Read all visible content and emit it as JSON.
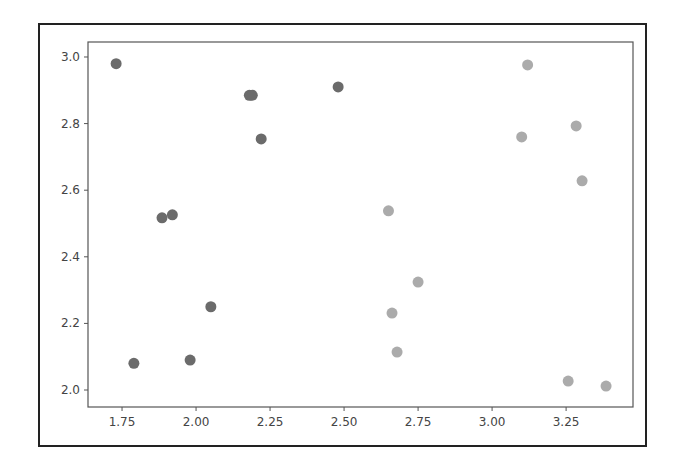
{
  "chart_data": {
    "type": "scatter",
    "title": "",
    "xlabel": "",
    "ylabel": "",
    "xlim": [
      1.635,
      3.476
    ],
    "ylim": [
      1.949,
      3.045
    ],
    "grid": false,
    "legend": null,
    "x_ticks": [
      {
        "value": 1.75,
        "label": "1.75"
      },
      {
        "value": 2.0,
        "label": "2.00"
      },
      {
        "value": 2.25,
        "label": "2.25"
      },
      {
        "value": 2.5,
        "label": "2.50"
      },
      {
        "value": 2.75,
        "label": "2.75"
      },
      {
        "value": 3.0,
        "label": "3.00"
      },
      {
        "value": 3.25,
        "label": "3.25"
      }
    ],
    "y_ticks": [
      {
        "value": 2.0,
        "label": "2.0"
      },
      {
        "value": 2.2,
        "label": "2.2"
      },
      {
        "value": 2.4,
        "label": "2.4"
      },
      {
        "value": 2.6,
        "label": "2.6"
      },
      {
        "value": 2.8,
        "label": "2.8"
      },
      {
        "value": 3.0,
        "label": "3.0"
      }
    ],
    "series": [
      {
        "name": "cluster-dark",
        "color": "#6b6b6b",
        "points": [
          {
            "x": 1.73,
            "y": 2.98
          },
          {
            "x": 1.79,
            "y": 2.08
          },
          {
            "x": 1.885,
            "y": 2.517
          },
          {
            "x": 1.92,
            "y": 2.526
          },
          {
            "x": 1.98,
            "y": 2.09
          },
          {
            "x": 2.05,
            "y": 2.25
          },
          {
            "x": 2.18,
            "y": 2.885
          },
          {
            "x": 2.19,
            "y": 2.885
          },
          {
            "x": 2.22,
            "y": 2.754
          },
          {
            "x": 2.48,
            "y": 2.91
          }
        ]
      },
      {
        "name": "cluster-light",
        "color": "#ababab",
        "points": [
          {
            "x": 2.65,
            "y": 2.538
          },
          {
            "x": 2.662,
            "y": 2.231
          },
          {
            "x": 2.679,
            "y": 2.114
          },
          {
            "x": 2.75,
            "y": 2.324
          },
          {
            "x": 3.1,
            "y": 2.76
          },
          {
            "x": 3.12,
            "y": 2.976
          },
          {
            "x": 3.257,
            "y": 2.027
          },
          {
            "x": 3.284,
            "y": 2.793
          },
          {
            "x": 3.304,
            "y": 2.628
          },
          {
            "x": 3.385,
            "y": 2.012
          }
        ]
      }
    ]
  },
  "style": {
    "axis_color": "#555555",
    "tick_label_color": "#444444",
    "frame_color": "#222222"
  }
}
